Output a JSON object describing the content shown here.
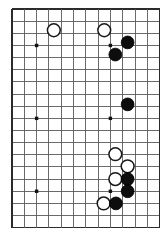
{
  "figure": {
    "kind": "go-board-diagram",
    "board_background_color": "#ffffff",
    "grid_line_color": "#5a5a5a",
    "edge_line_color": "#2b2b2b",
    "black_stone_color": "#0d0d0d",
    "white_stone_color": "#ffffff",
    "white_stone_outline_color": "#171717"
  },
  "chart_data": {
    "type": "table",
    "xlabel": "",
    "ylabel": "",
    "geometry": {
      "origin_x": 12,
      "origin_y": 9,
      "cell_width": 12.3,
      "cell_height": 12.15,
      "columns": 12,
      "rows": 18,
      "stone_radius": 6.4
    },
    "star_points": [
      {
        "col": 2,
        "row": 3
      },
      {
        "col": 2,
        "row": 9
      },
      {
        "col": 8,
        "row": 3
      },
      {
        "col": 8,
        "row": 9
      },
      {
        "col": 2,
        "row": 15
      },
      {
        "col": 8,
        "row": 15
      }
    ],
    "stones": [
      {
        "color": "white",
        "col": 3.4,
        "row": 1.75
      },
      {
        "color": "white",
        "col": 7.5,
        "row": 1.75
      },
      {
        "color": "black",
        "col": 9.4,
        "row": 2.75
      },
      {
        "color": "black",
        "col": 8.4,
        "row": 3.75
      },
      {
        "color": "black",
        "col": 9.4,
        "row": 7.85
      },
      {
        "color": "white",
        "col": 8.4,
        "row": 11.95
      },
      {
        "color": "white",
        "col": 9.4,
        "row": 12.95
      },
      {
        "color": "white",
        "col": 8.4,
        "row": 14.0
      },
      {
        "color": "black",
        "col": 9.4,
        "row": 14.0
      },
      {
        "color": "black",
        "col": 9.4,
        "row": 15.0
      },
      {
        "color": "white",
        "col": 7.45,
        "row": 16.0
      },
      {
        "color": "black",
        "col": 8.45,
        "row": 16.0
      }
    ],
    "counts": {
      "black_stones": 6,
      "white_stones": 6,
      "total_stones": 12
    }
  }
}
